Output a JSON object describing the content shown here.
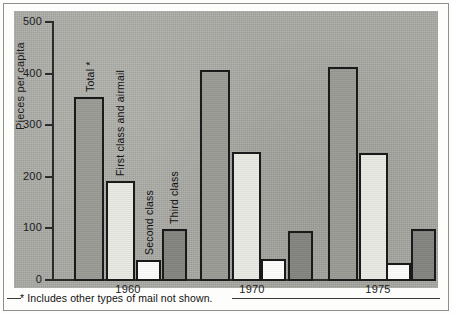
{
  "figure": {
    "background_color": "#a9a9a4",
    "page_color": "#fdfdfb",
    "footnote": "* Includes other types of mail not shown."
  },
  "axis": {
    "y_label": "Pieces per capita",
    "y_ticks": [
      "0",
      "100",
      "200",
      "300",
      "400",
      "500"
    ],
    "x_labels": [
      "1960",
      "1970",
      "1975"
    ]
  },
  "series_labels": {
    "total": "Total *",
    "first": "First class and airmail",
    "second": "Second class",
    "third": "Third class"
  },
  "colors": {
    "total": "#9a9a95",
    "first": "#e9e9e4",
    "second": "#fdfdfb",
    "third": "#838380",
    "outline": "#1a1a1a"
  },
  "chart_data": {
    "type": "bar",
    "title": "",
    "subtitle": "",
    "xlabel": "",
    "ylabel": "Pieces per capita",
    "categories": [
      "1960",
      "1970",
      "1975"
    ],
    "ylim": [
      0,
      500
    ],
    "yticks": [
      0,
      100,
      200,
      300,
      400,
      500
    ],
    "grid": false,
    "legend": "in-plot rotated labels",
    "annotations": [
      "* Includes other types of mail not shown."
    ],
    "series": [
      {
        "name": "Total *",
        "values": [
          356,
          409,
          415
        ],
        "color": "#9a9a95"
      },
      {
        "name": "First class and airmail",
        "values": [
          194,
          250,
          248
        ],
        "color": "#e9e9e4"
      },
      {
        "name": "Second class",
        "values": [
          41,
          43,
          35
        ],
        "color": "#fdfdfb"
      },
      {
        "name": "Third class",
        "values": [
          101,
          97,
          101
        ],
        "color": "#838380"
      }
    ]
  }
}
